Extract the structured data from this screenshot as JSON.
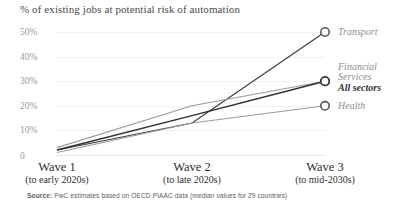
{
  "title": "% of existing jobs at potential risk of automation",
  "source_label": "Source:",
  "source_text": " PwC estimates based on OECD PIAAC data (median values for 29 countries)",
  "colors": {
    "dark_line": "#3b3b3b",
    "light_line": "#9b9b9b",
    "grid": "#f0f0ee",
    "tick_text": "#9a9a9a",
    "label_text": "#8d8d8d"
  },
  "chart_data": {
    "type": "line",
    "title": "% of existing jobs at potential risk of automation",
    "xlabel": "",
    "ylabel": "",
    "grid": true,
    "legend_position": "right-inline",
    "ylim": [
      0,
      50
    ],
    "yticks": [
      "0",
      "10%",
      "20%",
      "30%",
      "40%",
      "50%"
    ],
    "ytick_values": [
      0,
      10,
      20,
      30,
      40,
      50
    ],
    "categories": [
      "Wave 1",
      "Wave 2",
      "Wave 3"
    ],
    "category_sublabels": [
      "(to early 2020s)",
      "(to late 2020s)",
      "(to mid-2030s)"
    ],
    "series": [
      {
        "name": "Transport",
        "values": [
          2,
          13,
          50
        ],
        "emphasis": "normal",
        "color": "#3b3b3b"
      },
      {
        "name": "Financial Services",
        "values": [
          3,
          20,
          30
        ],
        "emphasis": "normal",
        "color": "#9b9b9b"
      },
      {
        "name": "All sectors",
        "values": [
          2,
          16,
          30
        ],
        "emphasis": "bold",
        "color": "#2e2e2e"
      },
      {
        "name": "Health",
        "values": [
          1,
          13,
          20
        ],
        "emphasis": "normal",
        "color": "#9b9b9b"
      }
    ]
  },
  "series_labels": [
    {
      "text": "Transport"
    },
    {
      "text": "Financial"
    },
    {
      "text": "Services"
    },
    {
      "text": "All sectors"
    },
    {
      "text": "Health"
    }
  ]
}
